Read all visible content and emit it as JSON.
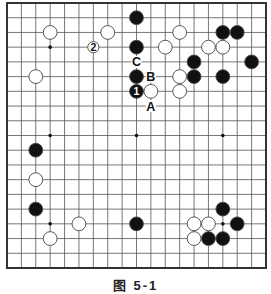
{
  "diagram": {
    "caption": "图 5-1",
    "board_size": 19,
    "colors": {
      "line": "#555555",
      "border": "#333333",
      "black": "#111111",
      "white": "#ffffff",
      "stone_outline": "#444444"
    },
    "stones": [
      {
        "color": "black",
        "col": 9,
        "row": 1
      },
      {
        "color": "black",
        "col": 9,
        "row": 3
      },
      {
        "color": "black",
        "col": 9,
        "row": 5
      },
      {
        "color": "black",
        "col": 9,
        "row": 6,
        "label": "1"
      },
      {
        "color": "white",
        "col": 10,
        "row": 6
      },
      {
        "color": "white",
        "col": 3,
        "row": 2
      },
      {
        "color": "white",
        "col": 7,
        "row": 2
      },
      {
        "color": "white",
        "col": 6,
        "row": 3,
        "label": "2",
        "small": true
      },
      {
        "color": "white",
        "col": 2,
        "row": 5
      },
      {
        "color": "white",
        "col": 12,
        "row": 2
      },
      {
        "color": "white",
        "col": 11,
        "row": 3
      },
      {
        "color": "white",
        "col": 12,
        "row": 5
      },
      {
        "color": "white",
        "col": 12,
        "row": 6
      },
      {
        "color": "black",
        "col": 13,
        "row": 4
      },
      {
        "color": "black",
        "col": 13,
        "row": 5
      },
      {
        "color": "white",
        "col": 14,
        "row": 3
      },
      {
        "color": "white",
        "col": 15,
        "row": 3
      },
      {
        "color": "black",
        "col": 15,
        "row": 2
      },
      {
        "color": "black",
        "col": 16,
        "row": 2
      },
      {
        "color": "black",
        "col": 17,
        "row": 4
      },
      {
        "color": "black",
        "col": 15,
        "row": 5
      },
      {
        "color": "black",
        "col": 2,
        "row": 10
      },
      {
        "color": "white",
        "col": 2,
        "row": 12
      },
      {
        "color": "black",
        "col": 2,
        "row": 14
      },
      {
        "color": "white",
        "col": 5,
        "row": 15
      },
      {
        "color": "white",
        "col": 3,
        "row": 16
      },
      {
        "color": "black",
        "col": 9,
        "row": 15
      },
      {
        "color": "white",
        "col": 13,
        "row": 15
      },
      {
        "color": "white",
        "col": 14,
        "row": 15
      },
      {
        "color": "black",
        "col": 15,
        "row": 14
      },
      {
        "color": "black",
        "col": 16,
        "row": 15
      },
      {
        "color": "white",
        "col": 13,
        "row": 16
      },
      {
        "color": "black",
        "col": 14,
        "row": 16
      },
      {
        "color": "black",
        "col": 15,
        "row": 16
      }
    ],
    "markers": [
      {
        "label": "A",
        "col": 10,
        "row": 7
      },
      {
        "label": "B",
        "col": 10,
        "row": 5
      },
      {
        "label": "C",
        "col": 9,
        "row": 4
      }
    ],
    "hoshi": [
      [
        3,
        3
      ],
      [
        9,
        3
      ],
      [
        15,
        3
      ],
      [
        3,
        9
      ],
      [
        9,
        9
      ],
      [
        15,
        9
      ],
      [
        3,
        15
      ],
      [
        9,
        15
      ],
      [
        15,
        15
      ]
    ]
  }
}
